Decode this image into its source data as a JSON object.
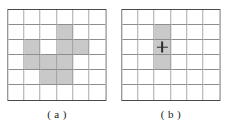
{
  "figure": {
    "panels": [
      {
        "id": "panel-a",
        "caption": "( a )",
        "grid": {
          "rows": 6,
          "cols": 6,
          "shaded_cells": [
            [
              1,
              3
            ],
            [
              2,
              1
            ],
            [
              2,
              3
            ],
            [
              2,
              4
            ],
            [
              3,
              1
            ],
            [
              3,
              2
            ],
            [
              3,
              3
            ],
            [
              4,
              2
            ],
            [
              4,
              3
            ]
          ],
          "marker": null
        }
      },
      {
        "id": "panel-b",
        "caption": "( b )",
        "grid": {
          "rows": 6,
          "cols": 6,
          "shaded_cells": [
            [
              1,
              2
            ],
            [
              2,
              2
            ],
            [
              3,
              2
            ]
          ],
          "marker": {
            "cell": [
              2,
              2
            ],
            "glyph": "plus",
            "name": "plus-marker"
          }
        }
      }
    ]
  },
  "colors": {
    "background": "#ffffff",
    "shaded_cell": "#c9c9c9",
    "grid_line": "#8d8d8d",
    "grid_border": "#4a4a4a",
    "marker": "#2b2b2b",
    "caption_text": "#1a1a1a"
  }
}
